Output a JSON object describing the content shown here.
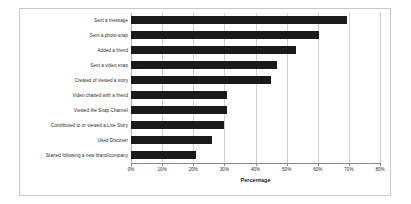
{
  "chart_data": {
    "type": "bar",
    "orientation": "horizontal",
    "title": "",
    "xlabel": "Percentage",
    "ylabel": "",
    "xlim": [
      0,
      80
    ],
    "xtick_labels": [
      "0%",
      "10%",
      "20%",
      "30%",
      "40%",
      "50%",
      "60%",
      "70%",
      "80%"
    ],
    "xtick_values": [
      0,
      10,
      20,
      30,
      40,
      50,
      60,
      70,
      80
    ],
    "grid": true,
    "legend": false,
    "bar_color": "#1a1a1a",
    "categories": [
      "Sent a message",
      "Sent a photo snap",
      "Added a friend",
      "Sent a video snap",
      "Created of viewed a story",
      "Video chatted with a friend",
      "Viewed the Snap Channel",
      "Contributed to or viewed a Live Story",
      "Used Discover",
      "Started following a new brand/company"
    ],
    "values": [
      69.5,
      60.5,
      53,
      47,
      45,
      31,
      31,
      30,
      26,
      21
    ]
  },
  "colors": {
    "bar": "#1a1a1a",
    "grid": "#d0d0d0",
    "axis": "#8a8a8a",
    "frame": "#c9c9c9",
    "text": "#2b2b2b",
    "background": "#ffffff"
  }
}
